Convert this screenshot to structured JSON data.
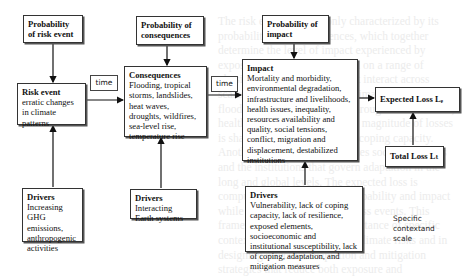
{
  "diagram": {
    "probability_risk_event": {
      "title": "Probability of risk event"
    },
    "probability_consequences": {
      "title": "Probability of consequences"
    },
    "probability_impact": {
      "title": "Probability of impact"
    },
    "risk_event": {
      "title": "Risk event",
      "body": "erratic changes in climate patterns"
    },
    "consequences": {
      "title": "Consequences",
      "body": "Flooding, tropical storms, landslides, heat waves, droughts, wildfires, sea-level rise, temperature rise"
    },
    "impact": {
      "title": "Impact",
      "body": "Mortality and morbidity, environmental degradation, infrastructure and livelihoods, health issues, inequality, resources availability and quality, social tensions, conflict, migration and displacement, destabilized institutions"
    },
    "expected_loss": {
      "title": "Expected Loss Lₑ"
    },
    "total_loss": {
      "title": "Total Loss Lₜ"
    },
    "drivers_risk": {
      "title": "Drivers",
      "body": "Increasing GHG emissions, anthropogenic activities"
    },
    "drivers_consequences": {
      "title": "Drivers",
      "body": "Interacting Earth systems"
    },
    "drivers_impact": {
      "title": "Drivers",
      "body": "Vulnerability, lack of coping capacity, lack of resilience, exposed elements, socioeconomic and institutional susceptibility, lack of coping, adaptation, and mitigation measures"
    },
    "time_labels": [
      "time",
      "time"
    ],
    "note": "Specific contextand scale"
  },
  "background_text": "The risk event is commonly characterized by its probability and consequences, which together determine the level of impact experienced by exposed systems. They depend on a range of physical and social drivers that interact across scales. The consequences of climate hazards such as floods and droughts cascade through infrastructure, health and livelihoods, and the magnitude of losses is shaped by vulnerability and coping capacity. Another class of drivers includes social structures and the institutions that govern adaptation in the long and global levels. The expected loss is computed as the product of probability and impact while total loss aggregates across events. This framework highlights the importance of specific context and scale in assessing climate risks and in designing effective adaptation and mitigation strategies that reduce both exposure and susceptibility over time."
}
